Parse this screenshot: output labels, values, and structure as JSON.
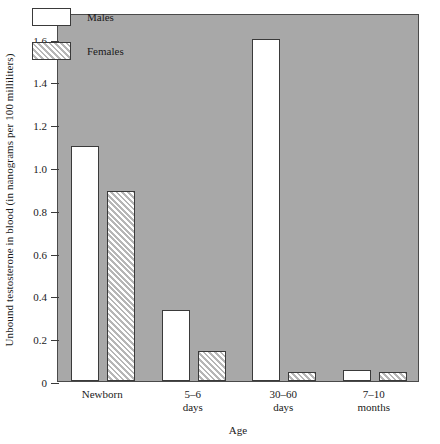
{
  "chart_data": {
    "type": "bar",
    "title": "",
    "xlabel": "Age",
    "ylabel": "Unbound testosterone in blood (in nanograms per 100 milliliters)",
    "categories": [
      "Newborn",
      "5–6\ndays",
      "30–60\ndays",
      "7–10\nmonths"
    ],
    "series": [
      {
        "name": "Males",
        "values": [
          1.1,
          0.33,
          1.6,
          0.05
        ]
      },
      {
        "name": "Females",
        "values": [
          0.89,
          0.14,
          0.04,
          0.04
        ]
      }
    ],
    "ylim": [
      0,
      1.72
    ],
    "yticks": [
      0,
      0.2,
      0.4,
      0.6,
      0.8,
      1.0,
      1.2,
      1.4,
      1.6
    ],
    "ytick_labels": [
      "0",
      "0.2",
      "0.4",
      "0.6",
      "0.8",
      "1.0",
      "1.2",
      "1.4",
      "1.6"
    ],
    "grid": false,
    "legend_position": "top-left",
    "colors": {
      "plot_background": "#a8a8a8",
      "page_background": "#ffffff",
      "axis": "#3a3a3a",
      "males_fill": "#ffffff",
      "females_hatch": "#b6b6b6"
    }
  },
  "legend": {
    "items": [
      {
        "label": "Males",
        "style": "solid-white"
      },
      {
        "label": "Females",
        "style": "diagonal-hatch"
      }
    ]
  }
}
